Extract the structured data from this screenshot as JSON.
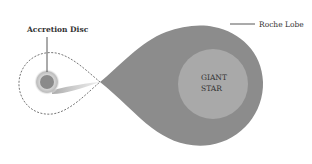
{
  "diagram": {
    "labels": {
      "accretion_disc": "Accretion Disc",
      "roche_lobe": "Roche Lobe",
      "giant_star_line1": "GIANT",
      "giant_star_line2": "STAR"
    },
    "colors": {
      "roche_lobe_fill": "#8c8c8c",
      "giant_star_fill": "#a8a8a8",
      "accretion_core": "#8a8a8a",
      "accretion_halo": "#c8c8c8",
      "dashed_outline": "#666666",
      "leader_line": "#444444",
      "background": "#ffffff"
    }
  }
}
